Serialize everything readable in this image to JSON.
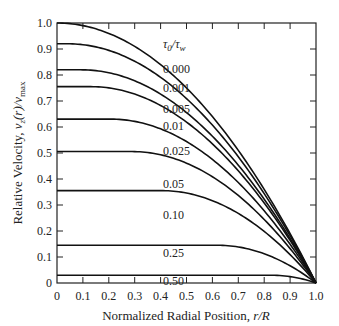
{
  "chart_data": {
    "type": "line",
    "title": "",
    "xlabel": "Normalized Radial Position, r/R",
    "ylabel": "Relative Velocity, v_z(r)/v_max",
    "xlim": [
      0,
      1.0
    ],
    "ylim": [
      0,
      1.0
    ],
    "grid": false,
    "x_ticks": [
      "0",
      "0.1",
      "0.2",
      "0.3",
      "0.4",
      "0.5",
      "0.6",
      "0.7",
      "0.8",
      "0.9",
      "1.0"
    ],
    "y_ticks": [
      "0",
      "0.1",
      "0.2",
      "0.3",
      "0.4",
      "0.5",
      "0.6",
      "0.7",
      "0.8",
      "0.9",
      "1.0"
    ],
    "legend_title": "τ0/τw",
    "series": [
      {
        "name": "0.000",
        "plateau": 1.0,
        "phi": 0.0
      },
      {
        "name": "0.001",
        "plateau": 0.92,
        "phi": 0.0408
      },
      {
        "name": "0.005",
        "plateau": 0.82,
        "phi": 0.0945
      },
      {
        "name": "0.01",
        "plateau": 0.755,
        "phi": 0.131
      },
      {
        "name": "0.025",
        "plateau": 0.63,
        "phi": 0.206
      },
      {
        "name": "0.05",
        "plateau": 0.505,
        "phi": 0.289
      },
      {
        "name": "0.10",
        "plateau": 0.355,
        "phi": 0.404
      },
      {
        "name": "0.25",
        "plateau": 0.145,
        "phi": 0.619
      },
      {
        "name": "0.50",
        "plateau": 0.03,
        "phi": 0.827
      }
    ],
    "label_positions": [
      {
        "x": 163,
        "y": 73
      },
      {
        "x": 163,
        "y": 92
      },
      {
        "x": 163,
        "y": 113
      },
      {
        "x": 163,
        "y": 130
      },
      {
        "x": 163,
        "y": 155
      },
      {
        "x": 163,
        "y": 188
      },
      {
        "x": 163,
        "y": 219
      },
      {
        "x": 163,
        "y": 257
      },
      {
        "x": 163,
        "y": 285
      }
    ]
  }
}
